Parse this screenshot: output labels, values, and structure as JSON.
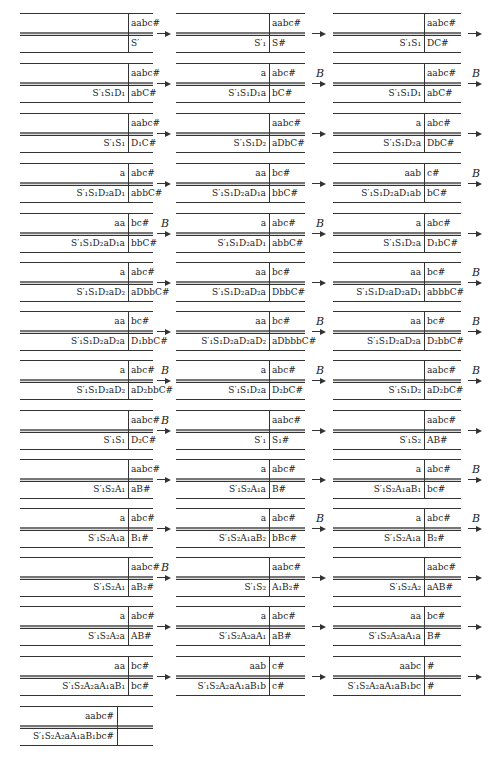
{
  "columns": [
    {
      "x": 20,
      "w": 133,
      "div": 108,
      "arrow_x": 157
    },
    {
      "x": 176,
      "w": 129,
      "div": 93,
      "arrow_x": 312
    },
    {
      "x": 333,
      "w": 128,
      "div": 91,
      "arrow_x": 468
    }
  ],
  "rows_y": [
    13,
    63,
    113,
    163,
    213,
    262,
    311,
    360,
    410,
    459,
    508,
    557,
    606,
    656,
    706
  ],
  "cells": [
    {
      "row": 0,
      "col": 0,
      "up_l": "",
      "up_r": "aabc#",
      "lo_l": "",
      "lo_r": "S′",
      "arrow": true,
      "b": false
    },
    {
      "row": 0,
      "col": 1,
      "up_l": "",
      "up_r": "aabc#",
      "lo_l": "S′₁",
      "lo_r": "S#",
      "arrow": true,
      "b": false
    },
    {
      "row": 0,
      "col": 2,
      "up_l": "",
      "up_r": "aabc#",
      "lo_l": "S′₁S₁",
      "lo_r": "DC#",
      "arrow": true,
      "b": false
    },
    {
      "row": 1,
      "col": 0,
      "up_l": "",
      "up_r": "aabc#",
      "lo_l": "S′₁S₁D₁",
      "lo_r": "abC#",
      "arrow": true,
      "b": false
    },
    {
      "row": 1,
      "col": 1,
      "up_l": "a",
      "up_r": "abc#",
      "lo_l": "S′₁S₁D₁a",
      "lo_r": "bC#",
      "arrow": true,
      "b": true
    },
    {
      "row": 1,
      "col": 2,
      "up_l": "",
      "up_r": "aabc#",
      "lo_l": "S′₁S₁D₁",
      "lo_r": "abC#",
      "arrow": true,
      "b": true
    },
    {
      "row": 2,
      "col": 0,
      "up_l": "",
      "up_r": "aabc#",
      "lo_l": "S′₁S₁",
      "lo_r": "D₁C#",
      "arrow": true,
      "b": false
    },
    {
      "row": 2,
      "col": 1,
      "up_l": "",
      "up_r": "aabc#",
      "lo_l": "S′₁S₁D₂",
      "lo_r": "aDbC#",
      "arrow": true,
      "b": false
    },
    {
      "row": 2,
      "col": 2,
      "up_l": "a",
      "up_r": "abc#",
      "lo_l": "S′₁S₁D₂a",
      "lo_r": "DbC#",
      "arrow": true,
      "b": false
    },
    {
      "row": 3,
      "col": 0,
      "up_l": "a",
      "up_r": "abc#",
      "lo_l": "S′₁S₁D₂aD₁",
      "lo_r": "abbC#",
      "arrow": true,
      "b": false
    },
    {
      "row": 3,
      "col": 1,
      "up_l": "aa",
      "up_r": "bc#",
      "lo_l": "S′₁S₁D₂aD₁a",
      "lo_r": "bbC#",
      "arrow": true,
      "b": false
    },
    {
      "row": 3,
      "col": 2,
      "up_l": "aab",
      "up_r": "c#",
      "lo_l": "S′₁S₁D₂aD₁ab",
      "lo_r": "bC#",
      "arrow": true,
      "b": true
    },
    {
      "row": 4,
      "col": 0,
      "up_l": "aa",
      "up_r": "bc#",
      "lo_l": "S′₁S₁D₂aD₁a",
      "lo_r": "bbC#",
      "arrow": true,
      "b": true
    },
    {
      "row": 4,
      "col": 1,
      "up_l": "a",
      "up_r": "abc#",
      "lo_l": "S′₁S₁D₂aD₁",
      "lo_r": "abbC#",
      "arrow": true,
      "b": true
    },
    {
      "row": 4,
      "col": 2,
      "up_l": "a",
      "up_r": "abc#",
      "lo_l": "S′₁S₁D₂a",
      "lo_r": "D₁bC#",
      "arrow": true,
      "b": false
    },
    {
      "row": 5,
      "col": 0,
      "up_l": "a",
      "up_r": "abc#",
      "lo_l": "S′₁S₁D₂aD₂",
      "lo_r": "aDbbC#",
      "arrow": true,
      "b": false
    },
    {
      "row": 5,
      "col": 1,
      "up_l": "aa",
      "up_r": "bc#",
      "lo_l": "S′₁S₁D₂aD₂a",
      "lo_r": "DbbC#",
      "arrow": true,
      "b": false
    },
    {
      "row": 5,
      "col": 2,
      "up_l": "aa",
      "up_r": "bc#",
      "lo_l": "S′₁S₁D₂aD₂aD₁",
      "lo_r": "abbbC#",
      "arrow": true,
      "b": true
    },
    {
      "row": 6,
      "col": 0,
      "up_l": "aa",
      "up_r": "bc#",
      "lo_l": "S′₁S₁D₂aD₂a",
      "lo_r": "D₁bbC#",
      "arrow": true,
      "b": false
    },
    {
      "row": 6,
      "col": 1,
      "up_l": "aa",
      "up_r": "bc#",
      "lo_l": "S′₁S₁D₂aD₂aD₂",
      "lo_r": "aDbbbC#",
      "arrow": true,
      "b": true
    },
    {
      "row": 6,
      "col": 2,
      "up_l": "aa",
      "up_r": "bc#",
      "lo_l": "S′₁S₁D₂aD₂a",
      "lo_r": "D₂bbC#",
      "arrow": true,
      "b": true
    },
    {
      "row": 7,
      "col": 0,
      "up_l": "a",
      "up_r": "abc#",
      "lo_l": "S′₁S₁D₂aD₂",
      "lo_r": "aD₂bbC#",
      "arrow": true,
      "b": true
    },
    {
      "row": 7,
      "col": 1,
      "up_l": "a",
      "up_r": "abc#",
      "lo_l": "S′₁S₁D₂a",
      "lo_r": "D₂bC#",
      "arrow": true,
      "b": true
    },
    {
      "row": 7,
      "col": 2,
      "up_l": "",
      "up_r": "aabc#",
      "lo_l": "S′₁S₁D₂",
      "lo_r": "aD₂bC#",
      "arrow": true,
      "b": true
    },
    {
      "row": 8,
      "col": 0,
      "up_l": "",
      "up_r": "aabc#",
      "lo_l": "S′₁S₁",
      "lo_r": "D₂C#",
      "arrow": true,
      "b": true
    },
    {
      "row": 8,
      "col": 1,
      "up_l": "",
      "up_r": "aabc#",
      "lo_l": "S′₁",
      "lo_r": "S₁#",
      "arrow": true,
      "b": false
    },
    {
      "row": 8,
      "col": 2,
      "up_l": "",
      "up_r": "aabc#",
      "lo_l": "S′₁S₂",
      "lo_r": "AB#",
      "arrow": true,
      "b": false
    },
    {
      "row": 9,
      "col": 0,
      "up_l": "",
      "up_r": "aabc#",
      "lo_l": "S′₁S₂A₁",
      "lo_r": "aB#",
      "arrow": true,
      "b": false
    },
    {
      "row": 9,
      "col": 1,
      "up_l": "a",
      "up_r": "abc#",
      "lo_l": "S′₁S₂A₁a",
      "lo_r": "B#",
      "arrow": true,
      "b": false
    },
    {
      "row": 9,
      "col": 2,
      "up_l": "a",
      "up_r": "abc#",
      "lo_l": "S′₁S₂A₁aB₁",
      "lo_r": "bc#",
      "arrow": true,
      "b": true
    },
    {
      "row": 10,
      "col": 0,
      "up_l": "a",
      "up_r": "abc#",
      "lo_l": "S′₁S₂A₁a",
      "lo_r": "B₁#",
      "arrow": true,
      "b": false
    },
    {
      "row": 10,
      "col": 1,
      "up_l": "a",
      "up_r": "abc#",
      "lo_l": "S′₁S₂A₁aB₂",
      "lo_r": "bBc#",
      "arrow": true,
      "b": true
    },
    {
      "row": 10,
      "col": 2,
      "up_l": "a",
      "up_r": "abc#",
      "lo_l": "S′₁S₂A₁a",
      "lo_r": "B₂#",
      "arrow": true,
      "b": true
    },
    {
      "row": 11,
      "col": 0,
      "up_l": "",
      "up_r": "aabc#",
      "lo_l": "S′₁S₂A₁",
      "lo_r": "aB₂#",
      "arrow": true,
      "b": true
    },
    {
      "row": 11,
      "col": 1,
      "up_l": "",
      "up_r": "aabc#",
      "lo_l": "S′₁S₂",
      "lo_r": "A₁B₂#",
      "arrow": true,
      "b": false
    },
    {
      "row": 11,
      "col": 2,
      "up_l": "",
      "up_r": "aabc#",
      "lo_l": "S′₁S₂A₂",
      "lo_r": "aAB#",
      "arrow": true,
      "b": false
    },
    {
      "row": 12,
      "col": 0,
      "up_l": "a",
      "up_r": "abc#",
      "lo_l": "S′₁S₂A₂a",
      "lo_r": "AB#",
      "arrow": true,
      "b": false
    },
    {
      "row": 12,
      "col": 1,
      "up_l": "a",
      "up_r": "abc#",
      "lo_l": "S′₁S₂A₂aA₁",
      "lo_r": "aB#",
      "arrow": true,
      "b": false
    },
    {
      "row": 12,
      "col": 2,
      "up_l": "aa",
      "up_r": "bc#",
      "lo_l": "S′₁S₂A₂aA₁a",
      "lo_r": "B#",
      "arrow": true,
      "b": false
    },
    {
      "row": 13,
      "col": 0,
      "up_l": "aa",
      "up_r": "bc#",
      "lo_l": "S′₁S₂A₂aA₁aB₁",
      "lo_r": "bc#",
      "arrow": true,
      "b": false
    },
    {
      "row": 13,
      "col": 1,
      "up_l": "aab",
      "up_r": "c#",
      "lo_l": "S′₁S₂A₂aA₁aB₁b",
      "lo_r": "c#",
      "arrow": true,
      "b": false
    },
    {
      "row": 13,
      "col": 2,
      "up_l": "aabc",
      "up_r": "#",
      "lo_l": "S′₁S₂A₂aA₁aB₁bc",
      "lo_r": "#",
      "arrow": true,
      "b": false
    },
    {
      "row": 14,
      "col": 0,
      "up_l": "aabc#",
      "up_r": "",
      "lo_l": "S′₁S₂A₂aA₁aB₁bc#",
      "lo_r": "",
      "arrow": false,
      "b": false,
      "div_override": 97
    }
  ],
  "arrow_label": "B"
}
